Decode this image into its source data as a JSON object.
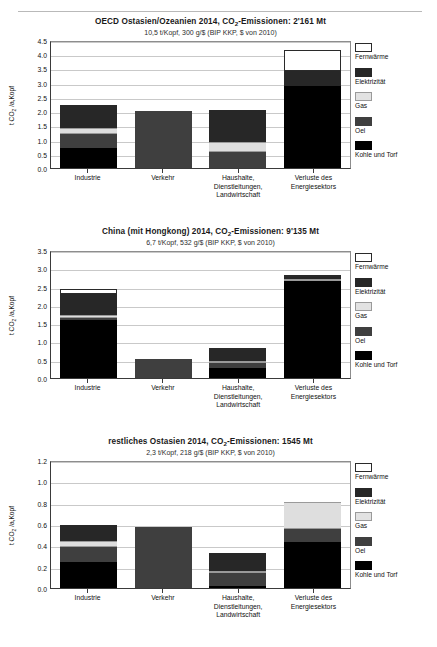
{
  "page": {
    "top_rule": true,
    "ghost_text": "—"
  },
  "legend": {
    "items": [
      {
        "key": "fernwaerme",
        "label": "Fernwärme",
        "color": "#ffffff"
      },
      {
        "key": "elektrizitaet",
        "label": "Elektrizität",
        "color": "#272727"
      },
      {
        "key": "gas",
        "label": "Gas",
        "color": "#e2e2e2"
      },
      {
        "key": "oel",
        "label": "Oel",
        "color": "#3f3f3f"
      },
      {
        "key": "kohle",
        "label": "Kohle und Torf",
        "color": "#000000"
      }
    ]
  },
  "chart_data": [
    {
      "id": "chart-1",
      "type": "bar",
      "stacked": true,
      "title_prefix": "OECD Ostasien/Ozeanien 2014, CO",
      "title_sub": "2",
      "title_suffix": "-Emissionen: 2'161 Mt",
      "subtitle": "10,5 t/Kopf, 300 g/$ (BIP KKP, $ von 2010)",
      "ylabel_prefix": "t CO",
      "ylabel_sub": "2",
      "ylabel_suffix": " /a,Kopf",
      "ylim": [
        0,
        4.5
      ],
      "yticks": [
        "0.0",
        "0.5",
        "1.0",
        "1.5",
        "2.0",
        "2.5",
        "3.0",
        "3.5",
        "4.0",
        "4.5"
      ],
      "ytick_values": [
        0.0,
        0.5,
        1.0,
        1.5,
        2.0,
        2.5,
        3.0,
        3.5,
        4.0,
        4.5
      ],
      "grid": true,
      "categories": [
        "Industrie",
        "Verkehr",
        "Haushalte, Dienstleitungen, Landwirtschaft",
        "Verluste des Energiesektors"
      ],
      "series": [
        {
          "name": "Kohle und Torf",
          "key": "kohle",
          "values": [
            0.7,
            0.0,
            0.0,
            2.87
          ]
        },
        {
          "name": "Oel",
          "key": "oel",
          "values": [
            0.48,
            2.01,
            0.58,
            0.0
          ]
        },
        {
          "name": "Gas",
          "key": "gas",
          "values": [
            0.24,
            0.0,
            0.32,
            0.0
          ]
        },
        {
          "name": "Elektrizität",
          "key": "elektrizitaet",
          "values": [
            0.8,
            0.0,
            1.15,
            0.53
          ]
        },
        {
          "name": "Fernwärme",
          "key": "fernwaerme",
          "values": [
            0.0,
            0.0,
            0.0,
            0.75
          ]
        }
      ],
      "totals": [
        2.22,
        2.01,
        2.05,
        4.15
      ]
    },
    {
      "id": "chart-2",
      "type": "bar",
      "stacked": true,
      "title_prefix": "China (mit Hongkong)  2014, CO",
      "title_sub": "2",
      "title_suffix": "-Emissionen: 9'135 Mt",
      "subtitle": "6,7 t/Kopf, 532 g/$ (BIP KKP, $ von 2010)",
      "ylabel_prefix": "t CO",
      "ylabel_sub": "2",
      "ylabel_suffix": " /a,Kopf",
      "ylim": [
        0,
        3.5
      ],
      "yticks": [
        "0.0",
        "0.5",
        "1.0",
        "1.5",
        "2.0",
        "2.5",
        "3.0",
        "3.5"
      ],
      "ytick_values": [
        0.0,
        0.5,
        1.0,
        1.5,
        2.0,
        2.5,
        3.0,
        3.5
      ],
      "grid": true,
      "categories": [
        "Industrie",
        "Verkehr",
        "Haushalte, Dienstleitungen, Landwirtschaft",
        "Verluste des Energiesektors"
      ],
      "series": [
        {
          "name": "Kohle und Torf",
          "key": "kohle",
          "values": [
            1.58,
            0.0,
            0.27,
            2.66
          ]
        },
        {
          "name": "Oel",
          "key": "oel",
          "values": [
            0.05,
            0.53,
            0.13,
            0.0
          ]
        },
        {
          "name": "Gas",
          "key": "gas",
          "values": [
            0.09,
            0.0,
            0.05,
            0.06
          ]
        },
        {
          "name": "Elektrizität",
          "key": "elektrizitaet",
          "values": [
            0.58,
            0.0,
            0.3,
            0.05
          ]
        },
        {
          "name": "Fernwärme",
          "key": "fernwaerme",
          "values": [
            0.14,
            0.0,
            0.05,
            0.02
          ]
        }
      ],
      "totals": [
        2.44,
        0.53,
        0.8,
        2.79
      ]
    },
    {
      "id": "chart-3",
      "type": "bar",
      "stacked": true,
      "title_prefix": "restliches Ostasien 2014, CO",
      "title_sub": "2",
      "title_suffix": "-Emissionen: 1545 Mt",
      "subtitle": "2,3 t/Kopf, 218 g/$ (BIP KKP, $ von 2010)",
      "ylabel_prefix": "t CO",
      "ylabel_sub": "2",
      "ylabel_suffix": " /a,Kopf",
      "ylim": [
        0,
        1.2
      ],
      "yticks": [
        "0.0",
        "0.2",
        "0.4",
        "0.6",
        "0.8",
        "1.0",
        "1.2"
      ],
      "ytick_values": [
        0.0,
        0.2,
        0.4,
        0.6,
        0.8,
        1.0,
        1.2
      ],
      "grid": true,
      "categories": [
        "Industrie",
        "Verkehr",
        "Haushalte, Dienstleitungen, Landwirtschaft",
        "Verluste des Energiesektors"
      ],
      "series": [
        {
          "name": "Kohle und Torf",
          "key": "kohle",
          "values": [
            0.245,
            0.0,
            0.015,
            0.435
          ]
        },
        {
          "name": "Oel",
          "key": "oel",
          "values": [
            0.14,
            0.575,
            0.125,
            0.115
          ]
        },
        {
          "name": "Gas",
          "key": "gas",
          "values": [
            0.055,
            0.0,
            0.005,
            0.26
          ]
        },
        {
          "name": "Elektrizität",
          "key": "elektrizitaet",
          "values": [
            0.15,
            0.0,
            0.17,
            0.0
          ]
        },
        {
          "name": "Fernwärme",
          "key": "fernwaerme",
          "values": [
            0.0,
            0.0,
            0.0,
            0.0
          ]
        }
      ],
      "totals": [
        0.59,
        0.575,
        0.315,
        0.81
      ]
    }
  ]
}
